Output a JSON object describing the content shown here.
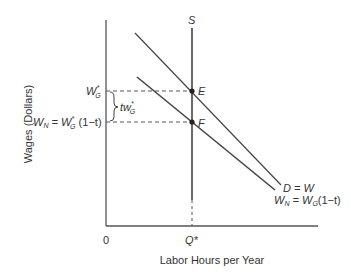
{
  "diagram": {
    "type": "labor-market-tax-incidence",
    "axes": {
      "y_label": "Wages (Dollars)",
      "x_label": "Labor Hours per Year",
      "origin_label": "0",
      "x_tick_label": "Q*"
    },
    "curves": {
      "supply": {
        "label": "S",
        "type": "vertical"
      },
      "demand_gross": {
        "label": "D = W"
      },
      "demand_net": {
        "label_lhs": "W",
        "label_lhs_sub": "N",
        "label_mid": " = W",
        "label_mid_sub": "G",
        "label_rhs": "(1−t)"
      }
    },
    "points": {
      "E": "E",
      "F": "F"
    },
    "y_ticks": {
      "gross_wage": {
        "main": "W",
        "sup": "*",
        "sub": "G"
      },
      "net_wage": {
        "prefix": "W",
        "prefix_sub": "N",
        "eq": " = W",
        "sup": "*",
        "sub": "G",
        "suffix": " (1−t)"
      }
    },
    "tax_wedge": {
      "main": "tw",
      "sup": "*",
      "sub": "G"
    },
    "colors": {
      "line": "#444444",
      "axis": "#555555",
      "text": "#333333",
      "dashed": "#555555"
    }
  }
}
